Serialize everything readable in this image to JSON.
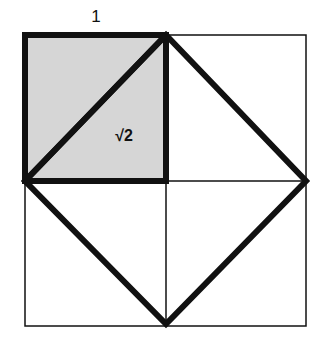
{
  "diagram": {
    "top_label": "1",
    "diagonal_label": "√2",
    "colors": {
      "shaded_fill": "#d6d6d6",
      "stroke": "#111111",
      "background": "#ffffff"
    }
  }
}
